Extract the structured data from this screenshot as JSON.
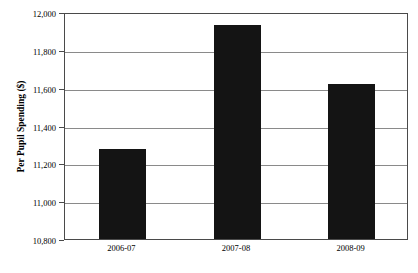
{
  "chart_data": {
    "type": "bar",
    "title": "",
    "xlabel": "",
    "ylabel": "Per Pupil Spending ($)",
    "categories": [
      "2006-07",
      "2007-08",
      "2008-09"
    ],
    "values": [
      11275,
      11930,
      11620
    ],
    "ylim": [
      10800,
      12000
    ],
    "ytick_values": [
      10800,
      11000,
      11200,
      11400,
      11600,
      11800,
      12000
    ],
    "ytick_labels": [
      "10,800",
      "11,000",
      "11,200",
      "11,400",
      "11,600",
      "11,800",
      "12,000"
    ],
    "grid": true,
    "legend": false,
    "bar_color": "#141414",
    "axis_color": "#4a4a4a",
    "grid_color": "#8a8a8a"
  }
}
